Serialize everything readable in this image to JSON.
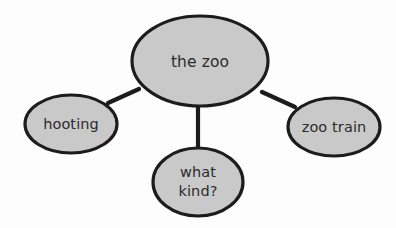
{
  "diagram": {
    "type": "concept-map",
    "background_color": "#fdfdfd",
    "node_fill_color": "#c9c9c9",
    "node_stroke_color": "#1c1c1c",
    "text_color": "#2b2b2b",
    "connector_color": "#1c1c1c",
    "central_node": {
      "id": "central",
      "label": "the zoo",
      "cx": 200,
      "cy": 61,
      "rx": 68,
      "ry": 45
    },
    "branch_nodes": [
      {
        "id": "hooting",
        "label": "hooting",
        "cx": 71,
        "cy": 124,
        "rx": 46,
        "ry": 29,
        "position": "left"
      },
      {
        "id": "zoo-train",
        "label": "zoo train",
        "cx": 334,
        "cy": 127,
        "rx": 46,
        "ry": 29,
        "position": "right"
      },
      {
        "id": "what-kind",
        "label": "what kind?",
        "label_lines": [
          "what",
          "kind?"
        ],
        "cx": 198,
        "cy": 182,
        "rx": 45,
        "ry": 34,
        "position": "bottom"
      }
    ],
    "connectors": [
      {
        "id": "central-to-hooting",
        "from": "central",
        "to": "hooting",
        "x1": 139,
        "y1": 89,
        "x2": 108,
        "y2": 103
      },
      {
        "id": "central-to-zoo-train",
        "from": "central",
        "to": "zoo-train",
        "x1": 262,
        "y1": 92,
        "x2": 295,
        "y2": 107
      },
      {
        "id": "central-to-what-kind",
        "from": "central",
        "to": "what-kind",
        "x1": 198,
        "y1": 105,
        "x2": 198,
        "y2": 149
      }
    ]
  }
}
